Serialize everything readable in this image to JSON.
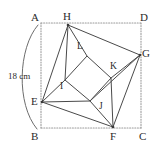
{
  "figure": {
    "type": "geometry-diagram",
    "measurement": {
      "label": "18 cm",
      "side": "AB"
    },
    "colors": {
      "stroke": "#4a4a4a",
      "dotted_stroke": "#9a9a9a",
      "label_text": "#2b2b2b",
      "background": "#ffffff"
    },
    "rectangle": {
      "name": "ABCD",
      "corners": [
        {
          "id": "A",
          "label": "A",
          "x": 41,
          "y": 23,
          "label_x": 31,
          "label_y": 12
        },
        {
          "id": "D",
          "label": "D",
          "x": 141,
          "y": 23,
          "label_x": 140,
          "label_y": 12
        },
        {
          "id": "C",
          "label": "C",
          "x": 141,
          "y": 128,
          "label_x": 139,
          "label_y": 131
        },
        {
          "id": "B",
          "label": "B",
          "x": 41,
          "y": 128,
          "label_x": 31,
          "label_y": 131
        }
      ]
    },
    "quadrilateral": {
      "name": "EFGH",
      "points": [
        {
          "id": "H",
          "label": "H",
          "x": 68,
          "y": 25,
          "label_x": 63,
          "label_y": 11
        },
        {
          "id": "G",
          "label": "G",
          "x": 140,
          "y": 55,
          "label_x": 142,
          "label_y": 48
        },
        {
          "id": "F",
          "label": "F",
          "x": 113,
          "y": 127,
          "label_x": 110,
          "label_y": 131
        },
        {
          "id": "E",
          "label": "E",
          "x": 42,
          "y": 102,
          "label_x": 31,
          "label_y": 96
        }
      ]
    },
    "inner_square": {
      "name": "IJKL",
      "points": [
        {
          "id": "L",
          "label": "L",
          "x": 87,
          "y": 56,
          "label_x": 77,
          "label_y": 42
        },
        {
          "id": "K",
          "label": "K",
          "x": 111,
          "y": 78,
          "label_x": 110,
          "label_y": 62
        },
        {
          "id": "J",
          "label": "J",
          "x": 90,
          "y": 101,
          "label_x": 99,
          "label_y": 102
        },
        {
          "id": "I",
          "label": "I",
          "x": 65,
          "y": 80,
          "label_x": 60,
          "label_y": 82
        }
      ]
    },
    "connectors": [
      {
        "from": "H",
        "to": "L"
      },
      {
        "from": "H",
        "to": "I"
      },
      {
        "from": "G",
        "to": "K"
      },
      {
        "from": "G",
        "to": "J"
      },
      {
        "from": "F",
        "to": "J"
      },
      {
        "from": "F",
        "to": "K"
      },
      {
        "from": "E",
        "to": "I"
      },
      {
        "from": "E",
        "to": "J"
      }
    ],
    "arc": {
      "label": "18 cm",
      "text_x": 8,
      "text_y": 72
    }
  }
}
